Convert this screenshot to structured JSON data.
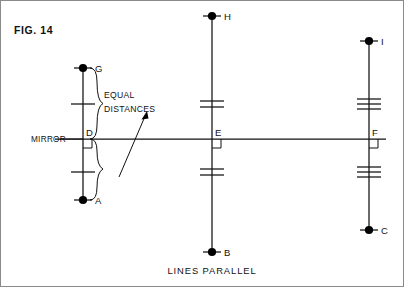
{
  "figure": {
    "number_label": "FIG. 14",
    "caption": "LINES PARALLEL",
    "mirror_label": "MIRROR",
    "note_line1": "EQUAL",
    "note_line2": "DISTANCES",
    "ink_color": "#111111",
    "frame_color": "#8a8a8a",
    "background": "#ffffff"
  },
  "mirror_axis": {
    "name": "mirror-line",
    "y": 139,
    "x_start": 55,
    "x_end": 386
  },
  "lines": [
    {
      "id": "left",
      "name": "line-GA",
      "x": 83,
      "top_label": "G",
      "bottom_label": "A",
      "mid_label": "D",
      "top_y": 68,
      "bottom_y": 200,
      "tick_count": 1,
      "tick_above_y": 104,
      "tick_below_y": 172,
      "right_angle": "below-right"
    },
    {
      "id": "middle",
      "name": "line-HB",
      "x": 212,
      "top_label": "H",
      "bottom_label": "B",
      "mid_label": "E",
      "top_y": 16,
      "bottom_y": 252,
      "tick_count": 2,
      "tick_above_y": 104,
      "tick_below_y": 172,
      "right_angle": "below-right"
    },
    {
      "id": "right",
      "name": "line-IC",
      "x": 369,
      "top_label": "I",
      "bottom_label": "C",
      "mid_label": "F",
      "top_y": 41,
      "bottom_y": 230,
      "tick_count": 3,
      "tick_above_y": 104,
      "tick_below_y": 172,
      "right_angle": "below-right"
    }
  ],
  "braces": [
    {
      "name": "brace-upper-equal-distance",
      "from_y": 68,
      "to_y": 139
    },
    {
      "name": "brace-lower-equal-distance",
      "from_y": 139,
      "to_y": 200
    }
  ],
  "annotations": {
    "arrow_name": "equal-distances-arrow",
    "arrow_from": [
      120,
      175
    ],
    "arrow_to": [
      147,
      113
    ]
  }
}
